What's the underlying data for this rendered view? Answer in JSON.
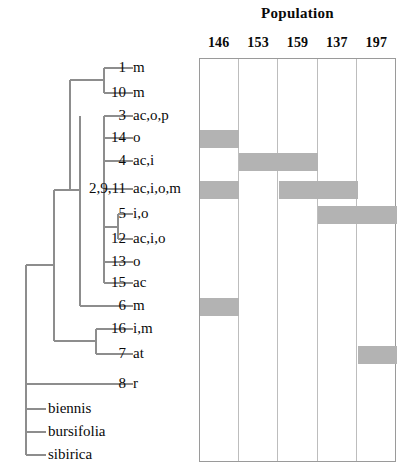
{
  "figure": {
    "matrix_title": "Population",
    "population_columns": [
      "146",
      "153",
      "159",
      "137",
      "197"
    ],
    "shade_color": "#b3b3b3"
  },
  "taxa": [
    {
      "id": "1",
      "states": "m",
      "y": 68,
      "shaded": []
    },
    {
      "id": "10",
      "states": "m",
      "y": 93,
      "shaded": []
    },
    {
      "id": "3",
      "states": "ac,o,p",
      "y": 116,
      "shaded": []
    },
    {
      "id": "14",
      "states": "o",
      "y": 138,
      "shaded": [
        "146"
      ]
    },
    {
      "id": "4",
      "states": "ac,i",
      "y": 161,
      "shaded": [
        "153",
        "159"
      ]
    },
    {
      "id": "2,9,11",
      "states": "ac,i,o,m",
      "y": 189,
      "shaded": [
        "146",
        "159",
        "137"
      ]
    },
    {
      "id": "5",
      "states": "i,o",
      "y": 214,
      "shaded": [
        "137",
        "197"
      ]
    },
    {
      "id": "12",
      "states": "ac,i,o",
      "y": 239,
      "shaded": []
    },
    {
      "id": "13",
      "states": "o",
      "y": 262,
      "shaded": []
    },
    {
      "id": "15",
      "states": "ac",
      "y": 283,
      "shaded": []
    },
    {
      "id": "6",
      "states": "m",
      "y": 306,
      "shaded": [
        "146"
      ]
    },
    {
      "id": "16",
      "states": "i,m",
      "y": 329,
      "shaded": []
    },
    {
      "id": "7",
      "states": "at",
      "y": 354,
      "shaded": [
        "197"
      ]
    },
    {
      "id": "8",
      "states": "r",
      "y": 384,
      "shaded": []
    }
  ],
  "outgroups": [
    {
      "name": "biennis",
      "y": 409
    },
    {
      "name": "bursifolia",
      "y": 432
    },
    {
      "name": "sibirica",
      "y": 455
    }
  ]
}
